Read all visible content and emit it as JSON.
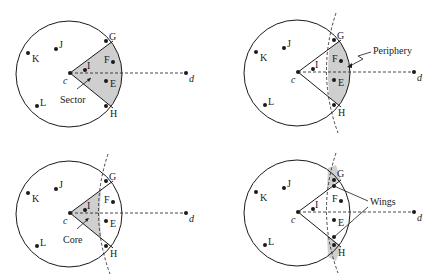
{
  "colors": {
    "stroke": "#1a1a1a",
    "shade": "#cfcfcf",
    "background": "#ffffff"
  },
  "points": {
    "c": "c",
    "d": "d",
    "E": "E",
    "F": "F",
    "G": "G",
    "H": "H",
    "I": "I",
    "J": "J",
    "K": "K",
    "L": "L"
  },
  "panels": [
    {
      "id": "sector",
      "annotation": "Sector"
    },
    {
      "id": "periphery",
      "annotation": "Periphery"
    },
    {
      "id": "core",
      "annotation": "Core"
    },
    {
      "id": "wings",
      "annotation": "Wings"
    }
  ]
}
